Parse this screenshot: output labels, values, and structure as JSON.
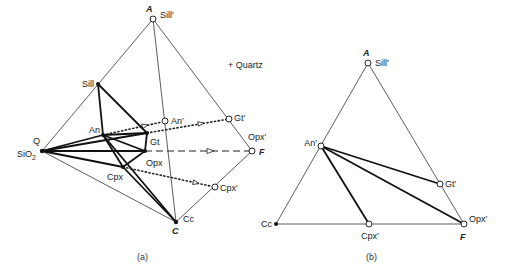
{
  "figure_a": {
    "caption": "(a)",
    "annotation": "+ Quartz",
    "labels": {
      "A": "A",
      "Sill_prime": "Sill′",
      "Sill": "Sill",
      "An": "An",
      "An_prime": "An′",
      "Gt": "Gt",
      "Gt_prime": "Gt′",
      "Q": "Q",
      "SiO2_main": "SiO",
      "SiO2_sub": "2",
      "Opx": "Opx",
      "Opx_prime": "Opx′",
      "F": "F",
      "Cpx": "Cpx",
      "Cpx_prime": "Cpx′",
      "Cc": "Cc",
      "C": "C"
    }
  },
  "figure_b": {
    "caption": "(b)",
    "labels": {
      "A": "A",
      "Sill_prime": "Sill′",
      "An_prime": "An′",
      "Gt_prime": "Gt′",
      "Cc": "Cc",
      "Cpx_prime": "Cpx′",
      "F": "F",
      "Opx_prime": "Opx′"
    }
  },
  "colors": {
    "background": "#ffffff",
    "line": "#111111",
    "text": "#222222"
  }
}
